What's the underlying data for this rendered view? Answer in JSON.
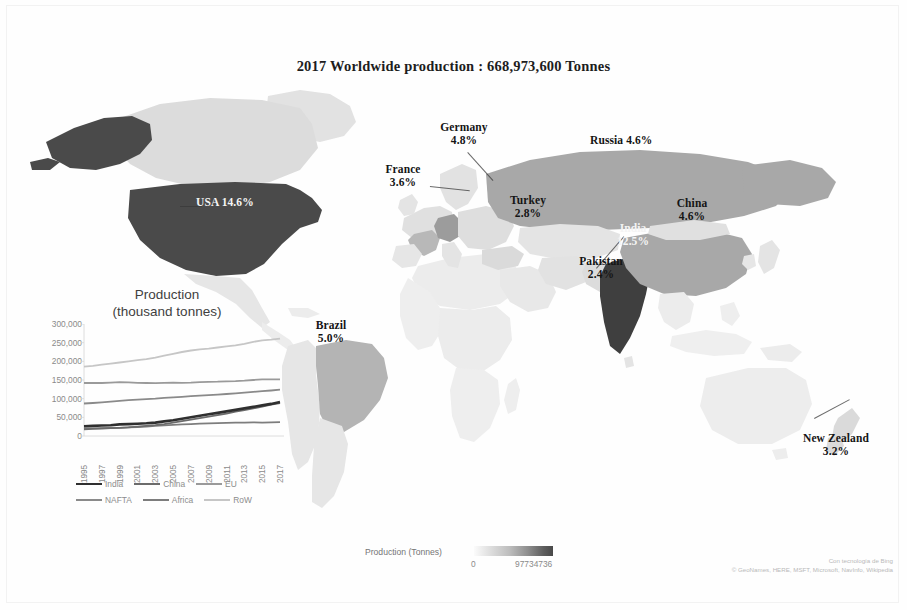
{
  "title": "2017 Worldwide  production : 668,973,600 Tonnes",
  "map": {
    "labels": [
      {
        "name": "USA",
        "pct": "14.6%",
        "style": "light",
        "inline": true
      },
      {
        "name": "Germany",
        "pct": "4.8%",
        "style": "dark",
        "inline": false
      },
      {
        "name": "France",
        "pct": "3.6%",
        "style": "dark",
        "inline": false
      },
      {
        "name": "Russia",
        "pct": "4.6%",
        "style": "dark",
        "inline": true
      },
      {
        "name": "Turkey",
        "pct": "2.8%",
        "style": "dark",
        "inline": false
      },
      {
        "name": "China",
        "pct": "4.6%",
        "style": "dark",
        "inline": false
      },
      {
        "name": "India",
        "pct": "12.5%",
        "style": "light",
        "inline": false
      },
      {
        "name": "Pakistan",
        "pct": "2.4%",
        "style": "dark",
        "inline": false
      },
      {
        "name": "Brazil",
        "pct": "5.0%",
        "style": "dark",
        "inline": false
      },
      {
        "name": "New Zealand",
        "pct": "3.2%",
        "style": "dark",
        "inline": false
      }
    ]
  },
  "colorbar": {
    "label": "Production (Tonnes)",
    "min": "0",
    "max": "97734736"
  },
  "attribution": {
    "line1": "Con tecnología de Bing",
    "line2": "© GeoNames, HERE, MSFT, Microsoft, NavInfo, Wikipedia"
  },
  "chart_data": {
    "type": "line",
    "title": "Production",
    "subtitle": "(thousand tonnes)",
    "xlabel": "",
    "ylabel": "",
    "ylim": [
      0,
      300000
    ],
    "yticks": [
      "300,000",
      "250,000",
      "200,000",
      "150,000",
      "100,000",
      "50,000",
      "0"
    ],
    "grid": false,
    "legend_position": "bottom",
    "x": [
      1995,
      1996,
      1997,
      1998,
      1999,
      2000,
      2001,
      2002,
      2003,
      2004,
      2005,
      2006,
      2007,
      2008,
      2009,
      2010,
      2011,
      2012,
      2013,
      2014,
      2015,
      2016,
      2017
    ],
    "xticks": [
      "1995",
      "1997",
      "1999",
      "2001",
      "2003",
      "2005",
      "2007",
      "2009",
      "2011",
      "2013",
      "2015",
      "2017"
    ],
    "series": [
      {
        "name": "India",
        "color": "#2f2f2f",
        "width": 2.6,
        "values": [
          26000,
          27000,
          28000,
          29000,
          31000,
          32000,
          33000,
          34000,
          36000,
          39000,
          42000,
          46000,
          50000,
          54000,
          58000,
          62000,
          66000,
          70000,
          74000,
          78000,
          82000,
          86000,
          91000
        ]
      },
      {
        "name": "China",
        "color": "#6b6b6b",
        "width": 1.8,
        "values": [
          18000,
          19000,
          20000,
          21000,
          22000,
          23000,
          25000,
          27000,
          29000,
          32000,
          36000,
          40000,
          44000,
          48000,
          52000,
          56000,
          60000,
          65000,
          69000,
          74000,
          79000,
          84000,
          88000
        ]
      },
      {
        "name": "EU",
        "color": "#9a9a9a",
        "width": 1.8,
        "values": [
          142000,
          142500,
          142000,
          143000,
          144000,
          143500,
          142500,
          142000,
          141500,
          142500,
          143000,
          142500,
          143000,
          144500,
          145000,
          145500,
          146500,
          147000,
          148000,
          150000,
          152000,
          151500,
          152000
        ]
      },
      {
        "name": "NAFTA",
        "color": "#8a8a8a",
        "width": 1.8,
        "values": [
          87000,
          88500,
          90000,
          92000,
          94000,
          96000,
          97500,
          98500,
          100000,
          102000,
          103500,
          105000,
          106500,
          108000,
          109500,
          111000,
          112500,
          114000,
          116000,
          118000,
          120000,
          122000,
          124000
        ]
      },
      {
        "name": "Africa",
        "color": "#7d7d7d",
        "width": 1.8,
        "values": [
          20000,
          20500,
          21000,
          21500,
          22000,
          23000,
          24000,
          25500,
          27000,
          28500,
          30000,
          31000,
          32000,
          33000,
          34000,
          34500,
          35000,
          35500,
          36000,
          36500,
          36000,
          36500,
          37000
        ]
      },
      {
        "name": "RoW",
        "color": "#c6c6c6",
        "width": 1.8,
        "values": [
          186000,
          188000,
          191000,
          194000,
          197000,
          200000,
          203000,
          206000,
          210000,
          215000,
          220000,
          225000,
          229000,
          232000,
          234000,
          237000,
          240000,
          243000,
          247000,
          252000,
          256000,
          258000,
          261000
        ]
      }
    ]
  }
}
